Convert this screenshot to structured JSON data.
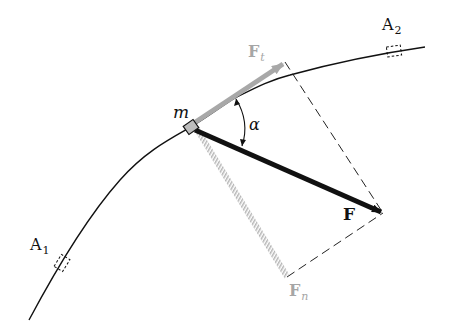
{
  "diagram": {
    "type": "force-decomposition",
    "labels": {
      "mass": "m",
      "force": "F",
      "tangential_force": {
        "main": "F",
        "sub": "t"
      },
      "normal_force": {
        "main": "F",
        "sub": "n"
      },
      "angle": "α",
      "point1": {
        "main": "A",
        "sub": "1"
      },
      "point2": {
        "main": "A",
        "sub": "2"
      }
    },
    "colors": {
      "curve": "#111111",
      "force": "#111111",
      "tangential": "#a8a8a8",
      "normal": "#bdbdbd",
      "dashed": "#222222",
      "component_label": "#a6a6a6"
    },
    "geometry": {
      "mass_position": [
        191,
        127
      ],
      "force_tip": [
        383,
        213
      ],
      "tangential_tip": [
        285,
        62
      ],
      "normal_tip": [
        287,
        277
      ],
      "curve_points": [
        [
          29,
          320
        ],
        [
          60,
          262
        ],
        [
          120,
          180
        ],
        [
          191,
          127
        ],
        [
          235,
          98
        ],
        [
          290,
          75
        ],
        [
          395,
          52
        ],
        [
          425,
          47
        ]
      ]
    }
  }
}
